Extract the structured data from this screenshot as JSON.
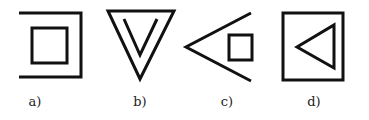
{
  "figures": [
    {
      "label": "a)",
      "description": "Inner square inside an open bracket (square open on the left side)",
      "shapes": [
        {
          "type": "polyline",
          "points": [
            [
              19,
              13
            ],
            [
              81,
              13
            ],
            [
              81,
              77
            ],
            [
              19,
              77
            ]
          ]
        },
        {
          "type": "rect",
          "x": 32,
          "y": 28,
          "w": 35,
          "h": 35
        }
      ],
      "label_x": 35
    },
    {
      "label": "b)",
      "description": "Downward-pointing triangle containing an inner V shape",
      "shapes": [
        {
          "type": "polygon",
          "points": [
            [
              108,
              11
            ],
            [
              174,
              11
            ],
            [
              140,
              79
            ]
          ]
        },
        {
          "type": "polyline",
          "points": [
            [
              124,
              19
            ],
            [
              140,
              55
            ],
            [
              157,
              19
            ]
          ]
        }
      ],
      "label_x": 140
    },
    {
      "label": "c)",
      "description": "Open angle (<) with a small square inside its opening",
      "shapes": [
        {
          "type": "polyline",
          "points": [
            [
              251,
              13
            ],
            [
              186,
              47
            ],
            [
              251,
              81
            ]
          ]
        },
        {
          "type": "rect",
          "x": 229,
          "y": 35,
          "w": 23,
          "h": 25
        }
      ],
      "label_x": 227
    },
    {
      "label": "d)",
      "description": "Square containing a left-pointing triangle",
      "shapes": [
        {
          "type": "rect",
          "x": 283,
          "y": 13,
          "w": 60,
          "h": 67
        },
        {
          "type": "polygon",
          "points": [
            [
              297,
              47
            ],
            [
              334,
              25
            ],
            [
              334,
              68
            ]
          ]
        }
      ],
      "label_x": 314
    }
  ],
  "style": {
    "stroke_color": "#111111",
    "stroke_width": 3,
    "label_color": "#222222"
  }
}
